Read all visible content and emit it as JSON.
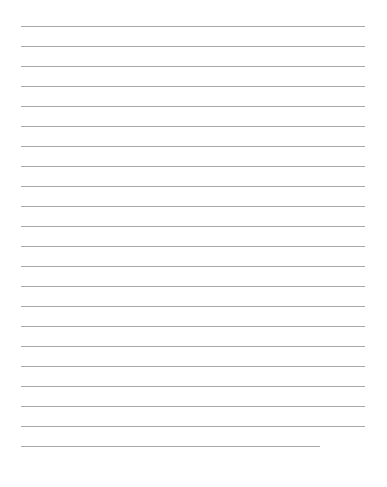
{
  "page": {
    "type": "lined-paper",
    "line_color": "#a9a9a9",
    "background": "#ffffff",
    "line_left": 21,
    "line_right": 365,
    "first_line_y": 26,
    "line_spacing": 20,
    "line_count": 22,
    "last_line_right": 320
  }
}
